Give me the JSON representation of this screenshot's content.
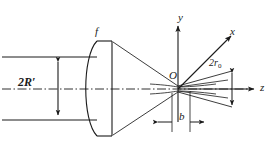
{
  "figure": {
    "type": "optics-ray-diagram",
    "colors": {
      "stroke": "#1a1a1a",
      "background": "#ffffff"
    }
  },
  "labels": {
    "focal_length": "f",
    "axis_y": "y",
    "axis_x": "x",
    "axis_z": "z",
    "origin": "O",
    "confocal_parameter": "b",
    "input_beam_diameter": "2R",
    "input_beam_diameter_prime": "′",
    "waist_diameter_base": "2r",
    "waist_diameter_sub": "0"
  },
  "elements": {
    "lens": "plano-convex-lens",
    "optical_axis": "dash-dot-centerline",
    "incoming_rays": "two-parallel-horizontal-rays",
    "converging_cone": "beam-cone-to-waist",
    "diverging_cone": "beam-cone-from-waist",
    "waist_marker": "double-arrow-vertical",
    "aperture_marker": "double-arrow-vertical",
    "b_marker": "double-arrow-horizontal"
  }
}
